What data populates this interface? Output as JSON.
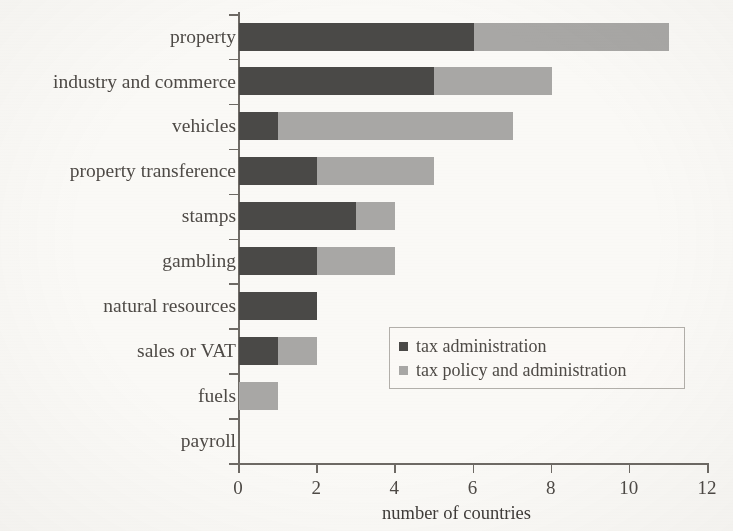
{
  "chart_data": {
    "type": "bar",
    "orientation": "horizontal",
    "stacked": true,
    "title": "",
    "xlabel": "number of countries",
    "ylabel": "",
    "xlim": [
      0,
      12
    ],
    "xticks": [
      0,
      2,
      4,
      6,
      8,
      10,
      12
    ],
    "xtick_labels": [
      "0",
      "2",
      "4",
      "6",
      "8",
      "10",
      "12"
    ],
    "grid": false,
    "legend_position": "center-right-inside",
    "categories": [
      "property",
      "industry and commerce",
      "vehicles",
      "property transference",
      "stamps",
      "gambling",
      "natural resources",
      "sales or VAT",
      "fuels",
      "payroll"
    ],
    "series": [
      {
        "name": "tax administration",
        "color": "#4a4947",
        "values": [
          6,
          5,
          1,
          2,
          3,
          2,
          2,
          1,
          0,
          0
        ]
      },
      {
        "name": "tax policy and administration",
        "color": "#a9a8a6",
        "values": [
          5,
          3,
          6,
          3,
          1,
          2,
          0,
          1,
          1,
          0
        ]
      }
    ],
    "totals": [
      11,
      8,
      7,
      5,
      4,
      4,
      2,
      2,
      1,
      0
    ]
  },
  "legend": {
    "items": [
      {
        "label": "tax administration",
        "color": "#4a4947"
      },
      {
        "label": "tax policy and administration",
        "color": "#a9a8a6"
      }
    ]
  },
  "colors": {
    "background": "#fbfaf7",
    "axis": "#6e6a65",
    "text": "#4e4a46",
    "series_dark": "#4a4947",
    "series_light": "#a9a8a6"
  }
}
